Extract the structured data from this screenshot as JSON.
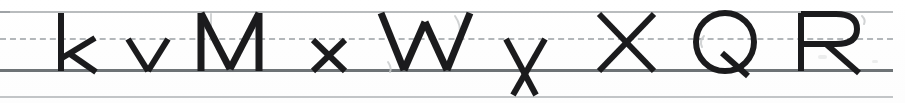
{
  "document": {
    "kind": "handwriting-practice-worksheet",
    "title": "Handwriting practice line",
    "ink_color": "#1b1b1d",
    "paper_color": "#ffffff"
  },
  "guide_lines": {
    "top_line": {
      "name": "top line",
      "y": 11,
      "color": "#b9bcbe",
      "style": "solid"
    },
    "mid_line": {
      "name": "dashed midline",
      "y": 38,
      "color": "#b3b7ba",
      "style": "dashed"
    },
    "base_line": {
      "name": "baseline",
      "y": 69,
      "color": "#6e7376",
      "style": "solid"
    },
    "bottom_line": {
      "name": "descender line",
      "y": 96,
      "color": "#c2c5c7",
      "style": "solid"
    }
  },
  "handwriting": {
    "text": "k v M x W y X Q R",
    "letters": [
      {
        "char": "k",
        "case": "lowercase",
        "zone": "ascender",
        "x": 60
      },
      {
        "char": "v",
        "case": "lowercase",
        "zone": "x-height",
        "x": 128
      },
      {
        "char": "M",
        "case": "uppercase",
        "zone": "cap-height",
        "x": 200
      },
      {
        "char": "x",
        "case": "lowercase",
        "zone": "x-height",
        "x": 312
      },
      {
        "char": "W",
        "case": "uppercase",
        "zone": "cap-height",
        "x": 380
      },
      {
        "char": "y",
        "case": "lowercase",
        "zone": "descender",
        "x": 505
      },
      {
        "char": "X",
        "case": "uppercase",
        "zone": "cap-height",
        "x": 598
      },
      {
        "char": "Q",
        "case": "uppercase",
        "zone": "cap-height",
        "x": 695
      },
      {
        "char": "R",
        "case": "uppercase",
        "zone": "cap-height",
        "x": 800
      }
    ]
  },
  "marks": {
    "ghost_strokes_note": "faint erased pencil guide strokes near M, W, Q and R"
  }
}
